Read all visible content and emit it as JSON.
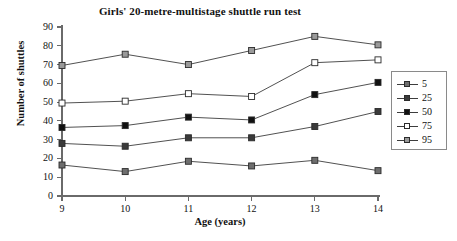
{
  "chart_data": {
    "type": "line",
    "title": "Girls' 20-metre-multistage shuttle run test",
    "xlabel": "Age (years)",
    "ylabel": "Number of shuttles",
    "x": [
      9,
      10,
      11,
      12,
      13,
      14
    ],
    "xtick_labels": [
      "9",
      "10",
      "11",
      "12",
      "13",
      "14"
    ],
    "ytick_labels": [
      "0",
      "10",
      "20",
      "30",
      "40",
      "50",
      "60",
      "70",
      "80",
      "90"
    ],
    "ytick_values": [
      0,
      10,
      20,
      30,
      40,
      50,
      60,
      70,
      80,
      90
    ],
    "xlim": [
      9,
      14
    ],
    "ylim": [
      0,
      90
    ],
    "grid": false,
    "legend_position": "right",
    "series": [
      {
        "name": "5",
        "label": "5",
        "marker": "square-filled",
        "marker_color": "#6e6e6e",
        "line_color": "#3d3d3d",
        "values": [
          16.5,
          13,
          18.5,
          16,
          19,
          13.5
        ]
      },
      {
        "name": "25",
        "label": "25",
        "marker": "square-filled",
        "marker_color": "#3a3a3a",
        "line_color": "#3d3d3d",
        "values": [
          28,
          26.5,
          31,
          31,
          37,
          45
        ]
      },
      {
        "name": "50",
        "label": "50",
        "marker": "square-filled",
        "marker_color": "#111111",
        "line_color": "#3d3d3d",
        "values": [
          36.5,
          37.5,
          42,
          40.5,
          54,
          60.5
        ]
      },
      {
        "name": "75",
        "label": "75",
        "marker": "square-open",
        "marker_color": "#ffffff",
        "line_color": "#3d3d3d",
        "values": [
          49.5,
          50.5,
          54.5,
          53,
          71,
          72.5
        ]
      },
      {
        "name": "95",
        "label": "95",
        "marker": "square-filled",
        "marker_color": "#9a9a9a",
        "line_color": "#3d3d3d",
        "values": [
          69.5,
          75.5,
          70,
          77.5,
          85,
          80.5
        ]
      }
    ]
  },
  "axes": {
    "axis_color": "#6a6a6a",
    "text_color": "#111111"
  }
}
